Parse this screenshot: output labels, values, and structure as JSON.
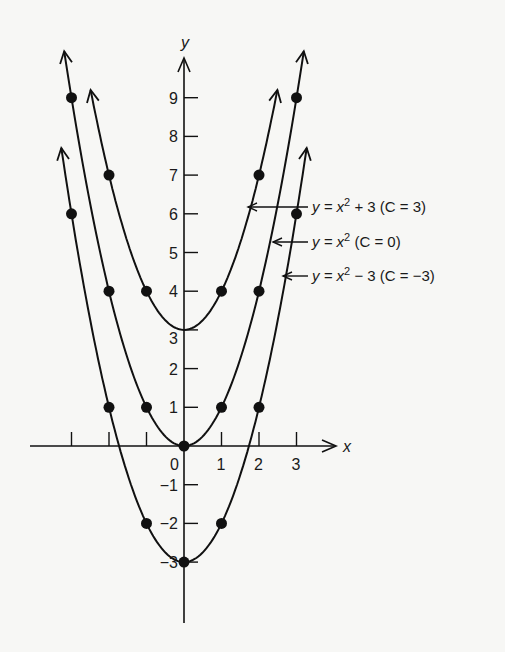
{
  "chart_data": {
    "type": "line",
    "title": "",
    "xlabel": "x",
    "ylabel": "y",
    "xlim": [
      -3.9,
      4.2
    ],
    "ylim": [
      -4.7,
      10
    ],
    "grid": false,
    "x_ticks": [
      -3,
      -2,
      -1,
      0,
      1,
      2,
      3
    ],
    "x_tick_labels": [
      "",
      "",
      "",
      "0",
      "1",
      "2",
      "3"
    ],
    "y_ticks": [
      -3,
      -2,
      -1,
      1,
      2,
      3,
      4,
      5,
      6,
      7,
      8,
      9
    ],
    "y_tick_labels": [
      "−3",
      "−2",
      "−1",
      "1",
      "2",
      "3",
      "4",
      "5",
      "6",
      "7",
      "8",
      "9"
    ],
    "series": [
      {
        "name": "y = x² + 3 (C = 3)",
        "label_parts": {
          "pre": "y = x",
          "sup": "2",
          "post": " + 3 (C = 3)"
        },
        "C": 3,
        "x": [
          -2,
          -1,
          0,
          1,
          2
        ],
        "y": [
          7,
          4,
          3,
          4,
          7
        ],
        "markers": [
          [
            -2,
            7
          ],
          [
            -1,
            4
          ],
          [
            1,
            4
          ],
          [
            2,
            7
          ]
        ]
      },
      {
        "name": "y = x² (C = 0)",
        "label_parts": {
          "pre": "y = x",
          "sup": "2",
          "post": " (C = 0)"
        },
        "C": 0,
        "x": [
          -3,
          -2,
          -1,
          0,
          1,
          2,
          3
        ],
        "y": [
          9,
          4,
          1,
          0,
          1,
          4,
          9
        ],
        "markers": [
          [
            -3,
            9
          ],
          [
            -2,
            4
          ],
          [
            -1,
            1
          ],
          [
            0,
            0
          ],
          [
            1,
            1
          ],
          [
            2,
            4
          ],
          [
            3,
            9
          ]
        ]
      },
      {
        "name": "y = x² − 3 (C = −3)",
        "label_parts": {
          "pre": "y = x",
          "sup": "2",
          "post": " − 3 (C = −3)"
        },
        "C": -3,
        "x": [
          -3,
          -2,
          -1,
          0,
          1,
          2,
          3
        ],
        "y": [
          6,
          1,
          -2,
          -3,
          -2,
          1,
          6
        ],
        "markers": [
          [
            -3,
            6
          ],
          [
            -2,
            1
          ],
          [
            -1,
            -2
          ],
          [
            0,
            -3
          ],
          [
            1,
            -2
          ],
          [
            2,
            1
          ],
          [
            3,
            6
          ]
        ]
      }
    ],
    "legend": "annotations with arrows pointing to right branches"
  }
}
